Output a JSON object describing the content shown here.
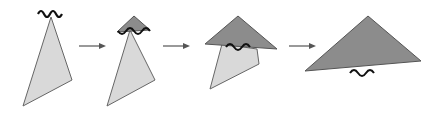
{
  "diagram": {
    "colors": {
      "background": "#ffffff",
      "light_fill": "#d9d9d9",
      "dark_fill": "#8c8c8c",
      "stroke": "#555555",
      "wave": "#111111",
      "arrow": "#555555"
    },
    "steps": [
      {
        "id": 1,
        "label": ""
      },
      {
        "id": 2,
        "label": ""
      },
      {
        "id": 3,
        "label": ""
      },
      {
        "id": 4,
        "label": ""
      }
    ],
    "arrows": 3
  }
}
